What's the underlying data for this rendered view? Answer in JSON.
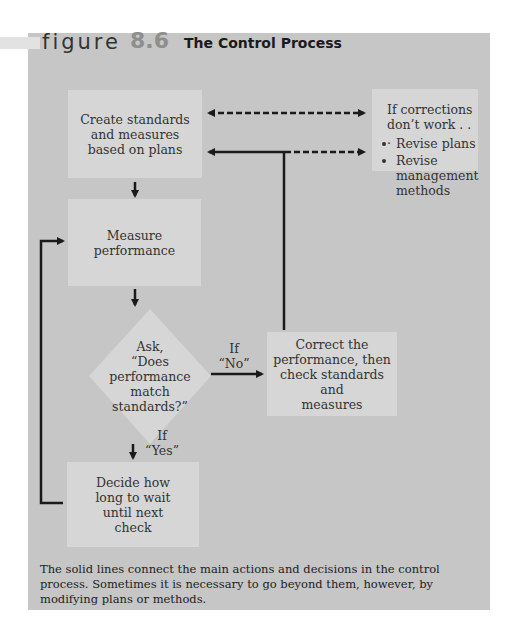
{
  "figure": {
    "label": "figure",
    "number": "8.6",
    "title": "The Control Process"
  },
  "nodes": {
    "create_standards": [
      "Create standards",
      "and measures",
      "based on plans"
    ],
    "measure_performance": [
      "Measure",
      "performance"
    ],
    "decision": [
      "Ask,",
      "“Does",
      "performance",
      "match",
      "standards?”"
    ],
    "correct_performance": [
      "Correct the",
      "performance, then",
      "check standards and",
      "measures"
    ],
    "decide_wait": [
      "Decide how",
      "long to wait",
      "until next",
      "check"
    ],
    "if_corrections_fail": {
      "heading": [
        "If corrections",
        "don’t work . . ."
      ],
      "items": [
        "Revise plans",
        "Revise management methods"
      ]
    }
  },
  "edge_labels": {
    "no": [
      "If",
      "“No”"
    ],
    "yes": [
      "If",
      "“Yes”"
    ]
  },
  "edges": [
    {
      "from": "create_standards",
      "to": "measure_performance",
      "style": "solid"
    },
    {
      "from": "measure_performance",
      "to": "decision",
      "style": "solid"
    },
    {
      "from": "decision",
      "to": "correct_performance",
      "style": "solid",
      "label": "If “No”"
    },
    {
      "from": "decision",
      "to": "decide_wait",
      "style": "solid",
      "label": "If “Yes”"
    },
    {
      "from": "decide_wait",
      "to": "measure_performance",
      "style": "solid"
    },
    {
      "from": "correct_performance",
      "to": "create_standards",
      "style": "solid"
    },
    {
      "from": "correct_performance",
      "to": "if_corrections_fail",
      "style": "dashed"
    },
    {
      "from": "create_standards",
      "to": "if_corrections_fail",
      "style": "dashed-bidirectional"
    }
  ],
  "caption": "The solid lines connect the main actions and decisions in the control process. Sometimes it is necessary to go beyond them, however, by modifying plans or methods.",
  "colors": {
    "panel": "#c6c6c6",
    "box": "#d6d6d6",
    "line": "#1a1a1a",
    "figure_number": "#8e8e8e"
  }
}
